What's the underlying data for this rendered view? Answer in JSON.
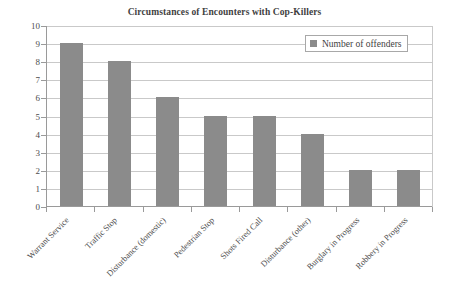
{
  "chart_data": {
    "type": "bar",
    "title": "Circumstances of Encounters with Cop-Killers",
    "xlabel": "",
    "ylabel": "",
    "ylim": [
      0,
      10
    ],
    "ytick_labels": [
      "10",
      "9",
      "8",
      "7",
      "6",
      "5",
      "4",
      "3",
      "2",
      "1",
      "0"
    ],
    "grid": true,
    "legend_position": "top-right",
    "categories": [
      "Warrant Service",
      "Traffic Stop",
      "Disturbance (domestic)",
      "Pedestrian Stop",
      "Shots Fired Call",
      "Disturbance (other)",
      "Burglary in Progress",
      "Robbery in Progress"
    ],
    "series": [
      {
        "name": "Number of offenders",
        "values": [
          9,
          8,
          6,
          5,
          5,
          4,
          2,
          2
        ],
        "color": "#8b8b8b"
      }
    ]
  },
  "legend": {
    "entries": [
      {
        "label": "Number of offenders",
        "color": "#8b8b8b"
      }
    ]
  },
  "colors": {
    "bar": "#8b8b8b",
    "gridline": "#c9c9c9",
    "axis": "#9a9a9a",
    "title_text": "#3f3f3f",
    "tick_text": "#4d4d4d",
    "background": "#ffffff"
  }
}
